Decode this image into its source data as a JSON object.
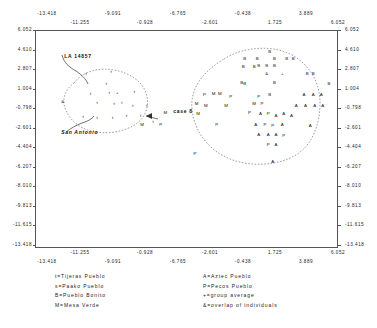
{
  "chart_data": {
    "type": "scatter",
    "title": "",
    "xlabel": "",
    "ylabel": "",
    "xlim": [
      -13.418,
      6.052
    ],
    "ylim": [
      -13.418,
      6.052
    ],
    "grid": false,
    "legend_position": "below-plot",
    "x_ticks_upper": [
      "-13.418",
      "-11.255",
      "-9.091",
      "-6.765",
      "-0.928",
      "-2.601",
      "-0.438",
      "1.725",
      "3.889",
      "6.052"
    ],
    "x_ticks_top_row": [
      "-13.418",
      "-9.091",
      "-6.765",
      "-0.438",
      "3.889"
    ],
    "x_ticks_bottom_row": [
      "-11.255",
      "-0.928",
      "-2.601",
      "1.725",
      "6.052"
    ],
    "x_ticks_lower_top_row": [
      "-11.255",
      "-0.928",
      "-2.601",
      "1.725",
      "6.052"
    ],
    "x_ticks_lower_bottom_row": [
      "-13.418",
      "-9.091",
      "-6.765",
      "-0.438",
      "3.889"
    ],
    "y_ticks": [
      "6.052",
      "4.610",
      "2.807",
      "1.004",
      "-0.798",
      "-2.601",
      "-4.404",
      "-6.207",
      "-8.010",
      "-9.813",
      "-11.615",
      "-13.418"
    ],
    "series": [
      {
        "name": "Tijeras Pueblo",
        "symbol": "t",
        "count": 22
      },
      {
        "name": "Paako Pueblo",
        "symbol": "s",
        "count": 0
      },
      {
        "name": "Pueblo Bonito",
        "symbol": "B",
        "count": 23
      },
      {
        "name": "Mesa Verde",
        "symbol": "M",
        "count": 12
      },
      {
        "name": "Aztec Pueblo",
        "symbol": "A",
        "count": 22
      },
      {
        "name": "Pecos Pueblo",
        "symbol": "P",
        "count": 21
      },
      {
        "name": "group average",
        "symbol": "+",
        "count": 2
      },
      {
        "name": "overlap of individuals",
        "symbol": "&",
        "count": 2
      }
    ],
    "points": [
      {
        "s": "t",
        "x": -10.2,
        "y": 2.2
      },
      {
        "s": "t",
        "x": -8.6,
        "y": 2.4
      },
      {
        "s": "t",
        "x": -8.9,
        "y": 1.3
      },
      {
        "s": "t",
        "x": -9.9,
        "y": 0.4
      },
      {
        "s": "t",
        "x": -8.7,
        "y": 0.5
      },
      {
        "s": "+",
        "x": -8.2,
        "y": 0.5
      },
      {
        "s": "t",
        "x": -7.1,
        "y": 0.6
      },
      {
        "s": "&",
        "x": -11.7,
        "y": -0.3
      },
      {
        "s": "t",
        "x": -9.5,
        "y": -0.4
      },
      {
        "s": "t",
        "x": -8.4,
        "y": -0.5
      },
      {
        "s": "t",
        "x": -7.9,
        "y": -0.4
      },
      {
        "s": "t",
        "x": -7.2,
        "y": -0.6
      },
      {
        "s": "t",
        "x": -6.3,
        "y": -0.6
      },
      {
        "s": "t",
        "x": -10.4,
        "y": -1.6
      },
      {
        "s": "t",
        "x": -9.5,
        "y": -1.7
      },
      {
        "s": "t",
        "x": -8.5,
        "y": -1.7
      },
      {
        "s": "t",
        "x": -7.6,
        "y": -1.5
      },
      {
        "s": "t",
        "x": -6.7,
        "y": -1.5
      },
      {
        "s": "t",
        "x": -5.9,
        "y": -2.1
      },
      {
        "s": "B",
        "x": 1.6,
        "y": 4.2
      },
      {
        "s": "B",
        "x": 0.0,
        "y": 3.6
      },
      {
        "s": "B",
        "x": 0.8,
        "y": 3.6
      },
      {
        "s": "B",
        "x": 1.9,
        "y": 3.6
      },
      {
        "s": "B",
        "x": 2.7,
        "y": 3.6
      },
      {
        "s": "B",
        "x": 3.1,
        "y": 3.6
      },
      {
        "s": "B",
        "x": -0.1,
        "y": 2.8
      },
      {
        "s": "B",
        "x": 0.6,
        "y": 2.8
      },
      {
        "s": "B",
        "x": 0.9,
        "y": 2.9
      },
      {
        "s": "B",
        "x": 1.4,
        "y": 2.9
      },
      {
        "s": "B",
        "x": 1.9,
        "y": 2.9
      },
      {
        "s": "&",
        "x": 1.4,
        "y": 2.2
      },
      {
        "s": "+",
        "x": 2.4,
        "y": 2.2
      },
      {
        "s": "B",
        "x": 4.0,
        "y": 2.2
      },
      {
        "s": "B",
        "x": 4.4,
        "y": 2.2
      },
      {
        "s": "B",
        "x": -0.2,
        "y": 1.4
      },
      {
        "s": "B",
        "x": 0.0,
        "y": 1.3
      },
      {
        "s": "B",
        "x": 1.9,
        "y": 1.4
      },
      {
        "s": "B",
        "x": 5.4,
        "y": 1.3
      },
      {
        "s": "M",
        "x": -2.0,
        "y": 0.4
      },
      {
        "s": "M",
        "x": -1.6,
        "y": 0.4
      },
      {
        "s": "P",
        "x": -2.6,
        "y": 0.3
      },
      {
        "s": "P",
        "x": -0.9,
        "y": 0.2
      },
      {
        "s": "P",
        "x": 0.9,
        "y": 0.2
      },
      {
        "s": "B",
        "x": 1.6,
        "y": 0.3
      },
      {
        "s": "A",
        "x": 3.8,
        "y": 0.3
      },
      {
        "s": "A",
        "x": 4.4,
        "y": 0.3
      },
      {
        "s": "A",
        "x": 4.9,
        "y": 0.3
      },
      {
        "s": "M",
        "x": -3.1,
        "y": -0.5
      },
      {
        "s": "M",
        "x": -2.5,
        "y": -0.6
      },
      {
        "s": "M",
        "x": -1.2,
        "y": -0.6
      },
      {
        "s": "M",
        "x": 0.6,
        "y": -0.5
      },
      {
        "s": "P",
        "x": 1.1,
        "y": -0.5
      },
      {
        "s": "A",
        "x": 3.3,
        "y": -0.6
      },
      {
        "s": "A",
        "x": 3.9,
        "y": -0.6
      },
      {
        "s": "A",
        "x": 4.5,
        "y": -0.6
      },
      {
        "s": "A",
        "x": 5.0,
        "y": -0.6
      },
      {
        "s": "M",
        "x": -5.1,
        "y": -1.3
      },
      {
        "s": "M",
        "x": -3.0,
        "y": -1.4
      },
      {
        "s": "P",
        "x": 0.3,
        "y": -1.3
      },
      {
        "s": "A",
        "x": 1.0,
        "y": -1.4
      },
      {
        "s": "P",
        "x": 1.5,
        "y": -1.4
      },
      {
        "s": "A",
        "x": 2.0,
        "y": -1.5
      },
      {
        "s": "A",
        "x": 2.5,
        "y": -1.4
      },
      {
        "s": "A",
        "x": 3.0,
        "y": -1.5
      },
      {
        "s": "M",
        "x": -6.6,
        "y": -2.3
      },
      {
        "s": "P",
        "x": -5.4,
        "y": -2.3
      },
      {
        "s": "P",
        "x": -1.8,
        "y": -2.3
      },
      {
        "s": "A",
        "x": 0.7,
        "y": -2.3
      },
      {
        "s": "P",
        "x": 1.3,
        "y": -2.3
      },
      {
        "s": "P",
        "x": 1.8,
        "y": -2.4
      },
      {
        "s": "A",
        "x": 2.4,
        "y": -2.3
      },
      {
        "s": "A",
        "x": 4.2,
        "y": -2.4
      },
      {
        "s": "A",
        "x": 0.9,
        "y": -3.2
      },
      {
        "s": "A",
        "x": 1.5,
        "y": -3.2
      },
      {
        "s": "A",
        "x": 2.0,
        "y": -3.2
      },
      {
        "s": "P",
        "x": 2.5,
        "y": -3.3
      },
      {
        "s": "P",
        "x": 1.5,
        "y": -4.1
      },
      {
        "s": "A",
        "x": 2.0,
        "y": -4.1
      },
      {
        "s": "P",
        "x": -3.2,
        "y": -4.9
      },
      {
        "s": "A",
        "x": 1.8,
        "y": -5.6
      }
    ],
    "annotations": [
      {
        "text": "LA 14857",
        "x": -11.6,
        "y": 3.8
      },
      {
        "text": "San Antonio",
        "x": -11.8,
        "y": -3.0
      },
      {
        "text": "case 8",
        "x": -4.6,
        "y": -1.1
      }
    ]
  },
  "axes": {
    "x_top_upper_row": [
      {
        "label": "-13.418",
        "left": 47
      },
      {
        "label": "-9.091",
        "left": 113
      },
      {
        "label": "-6.765",
        "left": 178
      },
      {
        "label": "-0.438",
        "left": 243
      },
      {
        "label": "3.889",
        "left": 306
      }
    ],
    "x_top_lower_row": [
      {
        "label": "-11.255",
        "left": 80
      },
      {
        "label": "-0.928",
        "left": 145
      },
      {
        "label": "-2.601",
        "left": 210
      },
      {
        "label": "1.725",
        "left": 275
      },
      {
        "label": "6.052",
        "left": 338
      }
    ],
    "x_bottom_upper_row": [
      {
        "label": "-11.255",
        "left": 80
      },
      {
        "label": "-0.928",
        "left": 145
      },
      {
        "label": "-2.601",
        "left": 210
      },
      {
        "label": "1.725",
        "left": 275
      },
      {
        "label": "6.052",
        "left": 338
      }
    ],
    "x_bottom_lower_row": [
      {
        "label": "-13.418",
        "left": 47
      },
      {
        "label": "-9.091",
        "left": 113
      },
      {
        "label": "-6.765",
        "left": 178
      },
      {
        "label": "-0.438",
        "left": 243
      },
      {
        "label": "3.889",
        "left": 306
      }
    ],
    "y_left": [
      {
        "label": "6.052",
        "top": 30
      },
      {
        "label": "4.610",
        "top": 50
      },
      {
        "label": "2.807",
        "top": 69
      },
      {
        "label": "1.004",
        "top": 89
      },
      {
        "label": "-0.798",
        "top": 108
      },
      {
        "label": "-2.601",
        "top": 128
      },
      {
        "label": "-4.404",
        "top": 147
      },
      {
        "label": "-6.207",
        "top": 167
      },
      {
        "label": "-8.010",
        "top": 186
      },
      {
        "label": "-9.813",
        "top": 206
      },
      {
        "label": "-11.615",
        "top": 225
      },
      {
        "label": "-13.418",
        "top": 245
      }
    ],
    "y_right": [
      {
        "label": "6.052",
        "top": 30
      },
      {
        "label": "4.610",
        "top": 50
      },
      {
        "label": "2.807",
        "top": 69
      },
      {
        "label": "1.004",
        "top": 89
      },
      {
        "label": "-0.798",
        "top": 108
      },
      {
        "label": "-2.601",
        "top": 128
      },
      {
        "label": "-4.404",
        "top": 147
      },
      {
        "label": "-6.207",
        "top": 167
      },
      {
        "label": "-8.010",
        "top": 186
      },
      {
        "label": "-9.813",
        "top": 206
      },
      {
        "label": "-11.615",
        "top": 225
      },
      {
        "label": "-13.418",
        "top": 245
      }
    ]
  },
  "legend": {
    "left_column": [
      "t=Tijeras Pueblo",
      "s=Paako Pueblo",
      "B=Pueblo Bonito",
      "M=Mesa Verde"
    ],
    "right_column": [
      "A=Aztec Pueblo",
      "P=Pecos Pueblo",
      "+=group average",
      "&=overlap of individuals"
    ]
  }
}
